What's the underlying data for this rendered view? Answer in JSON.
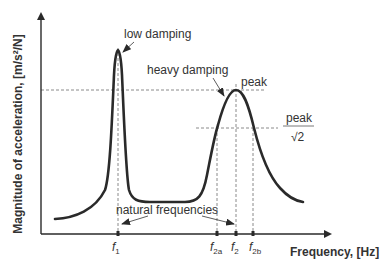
{
  "diagram": {
    "y_axis_label": "Magnitude of acceleration, [m/s²/N]",
    "x_axis_label": "Frequency, [Hz]",
    "annotations": {
      "low_damping": "low damping",
      "heavy_damping": "heavy damping",
      "peak": "peak",
      "peak_over_root2_num": "peak",
      "peak_over_root2_den": "√2",
      "natural_frequencies": "natural frequencies"
    },
    "ticks": [
      {
        "main": "f",
        "sub": "1"
      },
      {
        "main": "f",
        "sub": "2a"
      },
      {
        "main": "f",
        "sub": "2"
      },
      {
        "main": "f",
        "sub": "2b"
      }
    ],
    "colors": {
      "curve": "#2a2a2a",
      "dashed": "#8a8a8a",
      "text": "#333333"
    }
  }
}
